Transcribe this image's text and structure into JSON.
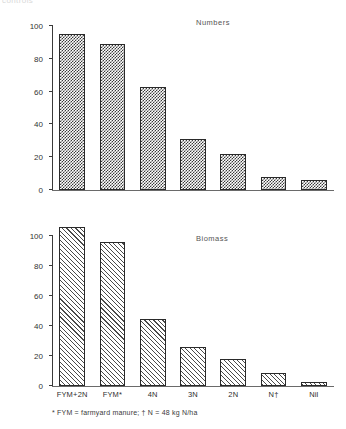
{
  "figure": {
    "clipped_caption": "controls",
    "footnote": "* FYM = farmyard manure; † N = 48 kg N/ha"
  },
  "categories": [
    "FYM+2N",
    "FYM*",
    "4N",
    "3N",
    "2N",
    "N†",
    "Nil"
  ],
  "axis": {
    "ticks": [
      "0",
      "20",
      "40",
      "60",
      "80",
      "100"
    ]
  },
  "chart_data": [
    {
      "type": "bar",
      "title": "Numbers",
      "categories": [
        "FYM+2N",
        "FYM*",
        "4N",
        "3N",
        "2N",
        "N†",
        "Nil"
      ],
      "values": [
        95,
        89,
        63,
        31,
        22,
        8,
        6
      ],
      "xlabel": "",
      "ylabel": "Numbers/m²",
      "ylim": [
        0,
        100
      ],
      "yticks": [
        0,
        20,
        40,
        60,
        80,
        100
      ],
      "grid": false,
      "legend": "none",
      "fill": "checkerboard"
    },
    {
      "type": "bar",
      "title": "Biomass",
      "categories": [
        "FYM+2N",
        "FYM*",
        "4N",
        "3N",
        "2N",
        "N†",
        "Nil"
      ],
      "values": [
        106,
        96,
        45,
        26,
        18,
        9,
        3
      ],
      "xlabel": "",
      "ylabel": "Weight (g/m²)",
      "ylim": [
        0,
        100
      ],
      "yticks": [
        0,
        20,
        40,
        60,
        80,
        100
      ],
      "grid": false,
      "legend": "none",
      "fill": "diagonal-hatch"
    }
  ]
}
